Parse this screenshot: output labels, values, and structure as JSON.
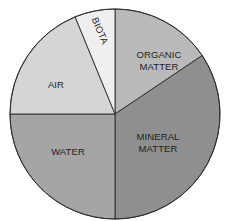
{
  "chart_data": {
    "type": "pie",
    "title": "",
    "start_angle_deg": 0,
    "direction": "clockwise",
    "center": [
      115,
      114
    ],
    "radius": 105,
    "slices": [
      {
        "name": "ORGANIC MATTER",
        "lines": [
          "ORGANIC",
          "MATTER"
        ],
        "value": 15.6,
        "color": "#bababa",
        "label_pos": [
          159,
          58
        ],
        "rotate": 0
      },
      {
        "name": "MINERAL MATTER",
        "lines": [
          "MINERAL",
          "MATTER"
        ],
        "value": 34.4,
        "color": "#8f8f8f",
        "label_pos": [
          158,
          140
        ],
        "rotate": 0
      },
      {
        "name": "WATER",
        "lines": [
          "WATER"
        ],
        "value": 25.0,
        "color": "#a5a5a5",
        "label_pos": [
          68,
          155
        ],
        "rotate": 0
      },
      {
        "name": "AIR",
        "lines": [
          "AIR"
        ],
        "value": 18.8,
        "color": "#d5d5d5",
        "label_pos": [
          56,
          88
        ],
        "rotate": 0
      },
      {
        "name": "BIOTA",
        "lines": [
          "BIOTA"
        ],
        "value": 6.2,
        "color": "#efefef",
        "label_pos": [
          97,
          32
        ],
        "rotate": 67
      }
    ],
    "legend": null,
    "labels_inside": true
  }
}
